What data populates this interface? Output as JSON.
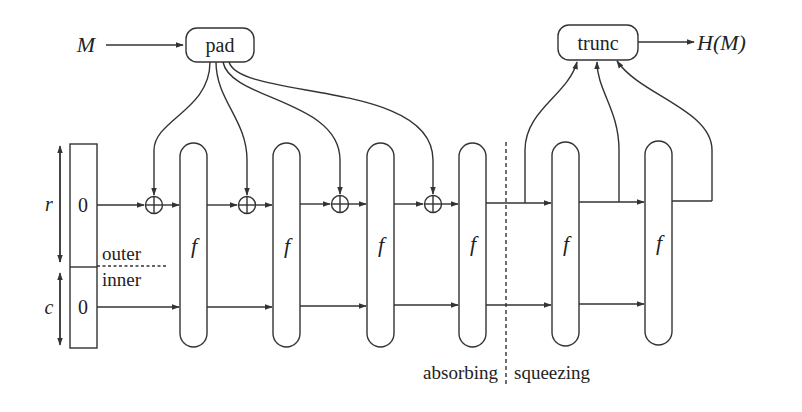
{
  "diagram": {
    "input_label": "M",
    "output_label": "H(M)",
    "pad_label": "pad",
    "trunc_label": "trunc",
    "rate_label": "r",
    "capacity_label": "c",
    "rate_init": "0",
    "capacity_init": "0",
    "outer_label": "outer",
    "inner_label": "inner",
    "function_label": "f",
    "phase_absorbing": "absorbing",
    "phase_squeezing": "squeezing",
    "absorbing_rounds": 4,
    "squeezing_rounds": 2,
    "colors": {
      "stroke": "#333333",
      "text": "#222222",
      "background": "#ffffff"
    }
  }
}
